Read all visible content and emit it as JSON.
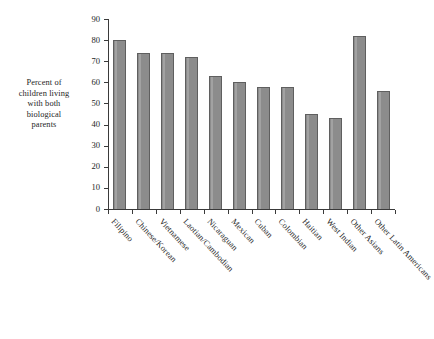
{
  "chart_data": {
    "type": "bar",
    "title": "",
    "subtitle": "",
    "xlabel": "",
    "ylabel": "Percent of children living with both biological parents",
    "ylabel_lines": [
      "Percent of",
      "children living",
      "with both",
      "biological",
      "parents"
    ],
    "ylim": [
      0,
      90
    ],
    "ytick_values": [
      0,
      10,
      20,
      30,
      40,
      50,
      60,
      70,
      80,
      90
    ],
    "ytick_labels": [
      "0",
      "10",
      "20",
      "30",
      "40",
      "50",
      "60",
      "70",
      "80",
      "90"
    ],
    "grid": false,
    "legend": false,
    "legend_position": "none",
    "bar_color": "#8c8c8c",
    "bar_edge_color": "#5f5f5f",
    "axis_color": "#3a3a3a",
    "categories": [
      "Filipino",
      "Chinese/Korean",
      "Vietnamese",
      "Laotian/Cambodian",
      "Nicaraguan",
      "Mexican",
      "Cuban",
      "Colombian",
      "Haitian",
      "West Indian",
      "Other Asians",
      "Other Latin Americans"
    ],
    "values": [
      80,
      74,
      74,
      72,
      63,
      60,
      58,
      58,
      45,
      43,
      82,
      56
    ],
    "series": [
      {
        "name": "Percent of children living with both biological parents",
        "values": [
          80,
          74,
          74,
          72,
          63,
          60,
          58,
          58,
          45,
          43,
          82,
          56
        ]
      }
    ]
  }
}
